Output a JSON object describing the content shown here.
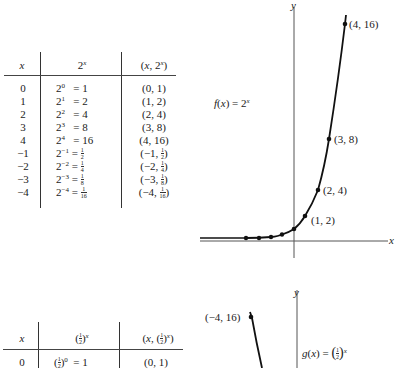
{
  "top_table": {
    "headers": [
      "x",
      "2^x",
      "(x, 2^x)"
    ],
    "rows": [
      {
        "x": "0",
        "expr_base": "2",
        "expr_exp": "0",
        "expr_val": "= 1",
        "pair": "(0, 1)"
      },
      {
        "x": "1",
        "expr_base": "2",
        "expr_exp": "1",
        "expr_val": "= 2",
        "pair": "(1, 2)"
      },
      {
        "x": "2",
        "expr_base": "2",
        "expr_exp": "2",
        "expr_val": "= 4",
        "pair": "(2, 4)"
      },
      {
        "x": "3",
        "expr_base": "2",
        "expr_exp": "3",
        "expr_val": "= 8",
        "pair": "(3, 8)"
      },
      {
        "x": "4",
        "expr_base": "2",
        "expr_exp": "4",
        "expr_val": "= 16",
        "pair": "(4, 16)"
      },
      {
        "x": "−1",
        "expr_base": "2",
        "expr_exp": "−1",
        "expr_val": "= 1/2",
        "pair": "(−1, 1/2)"
      },
      {
        "x": "−2",
        "expr_base": "2",
        "expr_exp": "−2",
        "expr_val": "= 1/4",
        "pair": "(−2, 1/4)"
      },
      {
        "x": "−3",
        "expr_base": "2",
        "expr_exp": "−3",
        "expr_val": "= 1/8",
        "pair": "(−3, 1/8)"
      },
      {
        "x": "−4",
        "expr_base": "2",
        "expr_exp": "−4",
        "expr_val": "= 1/16",
        "pair": "(−4, 1/16)"
      }
    ]
  },
  "bottom_table": {
    "headers": [
      "x",
      "(1/2)^x",
      "(x, (1/2)^x)"
    ],
    "rows": [
      {
        "x": "0",
        "expr": "(1/2)^0 = 1",
        "pair": "(0, 1)"
      }
    ]
  },
  "top_graph": {
    "function_label": "f(x) = 2^x",
    "axis_x_label": "x",
    "axis_y_label": "y",
    "point_labels": [
      "(4, 16)",
      "(3, 8)",
      "(2, 4)",
      "(1, 2)"
    ]
  },
  "bottom_graph": {
    "function_label": "g(x) = (1/2)^x",
    "axis_y_label": "y",
    "point_labels": [
      "(−4, 16)"
    ]
  },
  "chart_data": [
    {
      "type": "line",
      "title": "f(x) = 2^x",
      "xlabel": "x",
      "ylabel": "y",
      "x": [
        -4,
        -3,
        -2,
        -1,
        0,
        1,
        2,
        3,
        4
      ],
      "series": [
        {
          "name": "f(x) = 2^x",
          "values": [
            0.0625,
            0.125,
            0.25,
            0.5,
            1,
            2,
            4,
            8,
            16
          ]
        }
      ],
      "annotations": [
        "(4, 16)",
        "(3, 8)",
        "(2, 4)",
        "(1, 2)"
      ],
      "xlim": [
        -7,
        7
      ],
      "ylim": [
        0,
        17
      ],
      "grid": false
    },
    {
      "type": "line",
      "title": "g(x) = (1/2)^x",
      "xlabel": "x",
      "ylabel": "y",
      "x": [
        -4
      ],
      "series": [
        {
          "name": "g(x) = (1/2)^x",
          "values": [
            16
          ]
        }
      ],
      "annotations": [
        "(−4, 16)"
      ],
      "grid": false
    },
    {
      "type": "table",
      "title": "Values of 2^x",
      "columns": [
        "x",
        "2^x",
        "(x, 2^x)"
      ],
      "rows": [
        [
          "0",
          "2^0 = 1",
          "(0, 1)"
        ],
        [
          "1",
          "2^1 = 2",
          "(1, 2)"
        ],
        [
          "2",
          "2^2 = 4",
          "(2, 4)"
        ],
        [
          "3",
          "2^3 = 8",
          "(3, 8)"
        ],
        [
          "4",
          "2^4 = 16",
          "(4, 16)"
        ],
        [
          "−1",
          "2^−1 = 1/2",
          "(−1, 1/2)"
        ],
        [
          "−2",
          "2^−2 = 1/4",
          "(−2, 1/4)"
        ],
        [
          "−3",
          "2^−3 = 1/8",
          "(−3, 1/8)"
        ],
        [
          "−4",
          "2^−4 = 1/16",
          "(−4, 1/16)"
        ]
      ]
    },
    {
      "type": "table",
      "title": "Values of (1/2)^x",
      "columns": [
        "x",
        "(1/2)^x",
        "(x, (1/2)^x)"
      ],
      "rows": [
        [
          "0",
          "(1/2)^0 = 1",
          "(0, 1)"
        ]
      ]
    }
  ]
}
